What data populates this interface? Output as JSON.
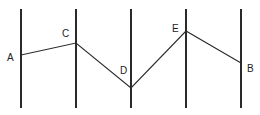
{
  "diagram": {
    "stroke_color": "#2a2a2a",
    "vertical_lines": [
      {
        "x": 21,
        "y1": 9,
        "y2": 108
      },
      {
        "x": 76,
        "y1": 9,
        "y2": 108
      },
      {
        "x": 131,
        "y1": 9,
        "y2": 108
      },
      {
        "x": 186,
        "y1": 9,
        "y2": 108
      },
      {
        "x": 241,
        "y1": 9,
        "y2": 108
      }
    ],
    "path_points": [
      {
        "label": "A",
        "x": 21,
        "y": 55,
        "label_x": 7,
        "label_y": 53
      },
      {
        "label": "C",
        "x": 76,
        "y": 43,
        "label_x": 62,
        "label_y": 29
      },
      {
        "label": "D",
        "x": 131,
        "y": 88,
        "label_x": 120,
        "label_y": 66
      },
      {
        "label": "E",
        "x": 186,
        "y": 31,
        "label_x": 172,
        "label_y": 24
      },
      {
        "label": "B",
        "x": 241,
        "y": 63,
        "label_x": 247,
        "label_y": 64
      }
    ]
  }
}
